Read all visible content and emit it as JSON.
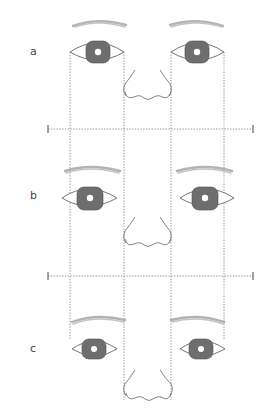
{
  "diagram": {
    "type": "facial-proportion-comparison",
    "panels": [
      {
        "label": "a",
        "description": "Eyes spaced one eye-width apart, aligned with nose width"
      },
      {
        "label": "b",
        "description": "Eyes spaced wider than one eye-width"
      },
      {
        "label": "c",
        "description": "Eyes spaced closer, inner corners inside guides"
      }
    ],
    "guides": {
      "vertical_lines_x": [
        70,
        124,
        171,
        224
      ],
      "horizontal_lines_y": [
        129,
        276
      ],
      "style": "dotted"
    },
    "colors": {
      "iris": "#6e6e6e",
      "outline": "#666666",
      "guide": "#8a8a8a",
      "brow": "#9a9a9a",
      "background": "#ffffff"
    }
  }
}
